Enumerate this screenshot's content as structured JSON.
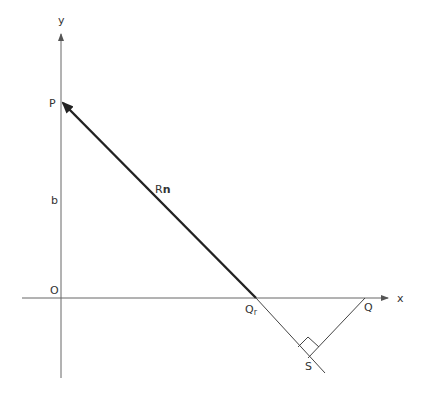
{
  "diagram": {
    "axes": {
      "x_label": "x",
      "y_label": "y",
      "origin_label": "O"
    },
    "points": {
      "P": "P",
      "Q": "Q",
      "Qr_main": "Q",
      "Qr_sub": "r",
      "S": "S"
    },
    "segment_labels": {
      "b": "b",
      "Rn_R": "R",
      "Rn_n": "n"
    },
    "colors": {
      "axis": "#555555",
      "line": "#333333",
      "vector": "#222222"
    }
  }
}
